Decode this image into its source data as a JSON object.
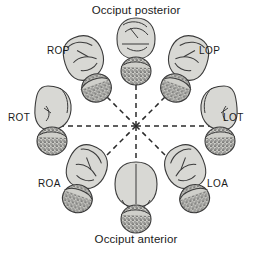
{
  "figure": {
    "title_top": "Occiput posterior",
    "title_bottom": "Occiput anterior",
    "width": 272,
    "height": 253,
    "background": "#ffffff"
  },
  "colors": {
    "outline": "#3a3a3a",
    "body_fill": "#d8d8d4",
    "head_fill": "#cfcfca",
    "stipple": "#4a4a4a",
    "dashed_line": "#2b2b2b",
    "text": "#1a1a1a"
  },
  "captions": [
    {
      "id": "cap-top",
      "text": "Occiput posterior",
      "position": "top-center"
    },
    {
      "id": "cap-bottom",
      "text": "Occiput anterior",
      "position": "bottom-center"
    }
  ],
  "center": {
    "x": 136,
    "y": 126
  },
  "positions": [
    {
      "id": "op",
      "label": "",
      "abbr": "OP",
      "angle_deg": 90,
      "label_side": "none",
      "view": "posterior-back",
      "figure_center": {
        "x": 136,
        "y": 52
      }
    },
    {
      "id": "rop",
      "label": "ROP",
      "abbr": "ROP",
      "angle_deg": 135,
      "label_side": "left",
      "view": "oblique-right-posterior",
      "figure_center": {
        "x": 86,
        "y": 70
      }
    },
    {
      "id": "rot",
      "label": "ROT",
      "abbr": "ROT",
      "angle_deg": 180,
      "label_side": "left",
      "view": "profile-right",
      "figure_center": {
        "x": 56,
        "y": 122
      }
    },
    {
      "id": "roa",
      "label": "ROA",
      "abbr": "ROA",
      "angle_deg": 225,
      "label_side": "left",
      "view": "oblique-right-anterior",
      "figure_center": {
        "x": 86,
        "y": 180
      }
    },
    {
      "id": "oa",
      "label": "",
      "abbr": "OA",
      "angle_deg": 270,
      "label_side": "none",
      "view": "anterior-front",
      "figure_center": {
        "x": 136,
        "y": 198
      }
    },
    {
      "id": "loa",
      "label": "LOA",
      "abbr": "LOA",
      "angle_deg": 315,
      "label_side": "right",
      "view": "oblique-left-anterior",
      "figure_center": {
        "x": 186,
        "y": 180
      }
    },
    {
      "id": "lot",
      "label": "LOT",
      "abbr": "LOT",
      "angle_deg": 0,
      "label_side": "right",
      "view": "profile-left",
      "figure_center": {
        "x": 216,
        "y": 122
      }
    },
    {
      "id": "lop",
      "label": "LOP",
      "abbr": "LOP",
      "angle_deg": 45,
      "label_side": "right",
      "view": "oblique-left-posterior",
      "figure_center": {
        "x": 186,
        "y": 70
      }
    }
  ],
  "spokes": {
    "count": 8,
    "style": "dashed",
    "dash_pattern": "5 4",
    "length": 82,
    "angles_deg": [
      0,
      45,
      90,
      135,
      180,
      225,
      270,
      315
    ]
  }
}
